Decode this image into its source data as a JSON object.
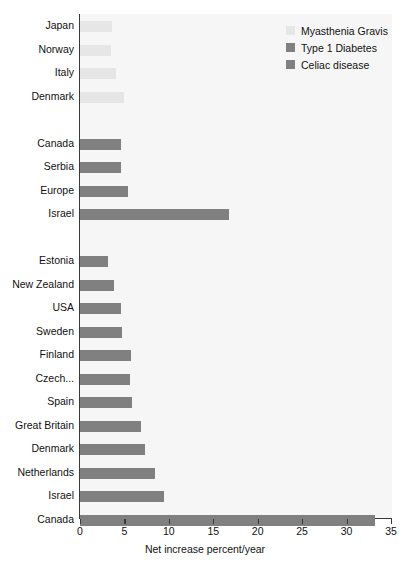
{
  "chart_data": {
    "type": "bar",
    "orientation": "horizontal",
    "title": "",
    "xlabel": "Net increase percent/year",
    "ylabel": "",
    "xlim": [
      0,
      35
    ],
    "xticks": [
      0,
      5,
      10,
      15,
      20,
      25,
      30,
      35
    ],
    "grid": false,
    "legend_position": "top-right",
    "colors": {
      "myasthenia_gravis": "#e6e6e6",
      "type_1_diabetes": "#808080",
      "celiac_disease": "#808080",
      "plot_background": "#f6f6f6",
      "axis": "#3a3a3a",
      "text": "#111111"
    },
    "legend": [
      {
        "label": "Myasthenia Gravis",
        "color": "#e6e6e6",
        "key": "mg"
      },
      {
        "label": "Type 1 Diabetes",
        "color": "#808080",
        "key": "t1d"
      },
      {
        "label": "Celiac disease",
        "color": "#808080",
        "key": "cd"
      }
    ],
    "series": [
      {
        "name": "Myasthenia Gravis",
        "key": "mg",
        "categories": [
          "Japan",
          "Norway",
          "Italy",
          "Denmark"
        ],
        "values": [
          3.6,
          3.5,
          4.0,
          4.9
        ]
      },
      {
        "name": "Type 1 Diabetes",
        "key": "t1d",
        "categories": [
          "Canada",
          "Serbia",
          "Europe",
          "Israel"
        ],
        "values": [
          4.6,
          4.6,
          5.4,
          16.8
        ]
      },
      {
        "name": "Celiac disease",
        "key": "cd",
        "categories": [
          "Estonia",
          "New Zealand",
          "USA",
          "Sweden",
          "Finland",
          "Czech...",
          "Spain",
          "Great Britain",
          "Denmark",
          "Netherlands",
          "Israel",
          "Canada"
        ],
        "values": [
          3.2,
          3.8,
          4.6,
          4.7,
          5.7,
          5.6,
          5.9,
          6.9,
          7.3,
          8.4,
          9.5,
          33.2
        ]
      }
    ]
  }
}
